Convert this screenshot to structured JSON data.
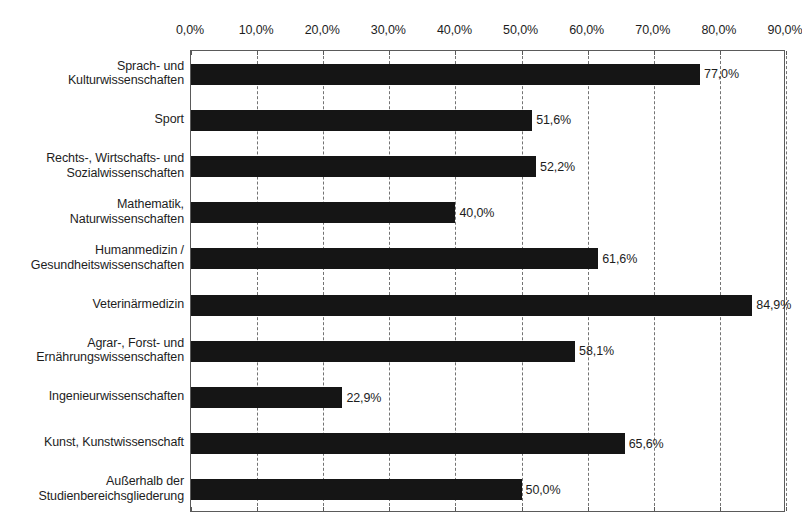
{
  "chart_data": {
    "type": "bar",
    "orientation": "horizontal",
    "title": "",
    "subtitle": "",
    "xlabel": "",
    "ylabel": "",
    "xlim": [
      0,
      90
    ],
    "grid": true,
    "legend": false,
    "value_label_suffix": "%",
    "decimal_separator": ",",
    "x_ticks": [
      {
        "value": 0,
        "label": "0,0%"
      },
      {
        "value": 10,
        "label": "10,0%"
      },
      {
        "value": 20,
        "label": "20,0%"
      },
      {
        "value": 30,
        "label": "30,0%"
      },
      {
        "value": 40,
        "label": "40,0%"
      },
      {
        "value": 50,
        "label": "50,0%"
      },
      {
        "value": 60,
        "label": "60,0%"
      },
      {
        "value": 70,
        "label": "70,0%"
      },
      {
        "value": 80,
        "label": "80,0%"
      },
      {
        "value": 90,
        "label": "90,0%"
      }
    ],
    "categories": [
      "Sprach- und Kulturwissenschaften",
      "Sport",
      "Rechts-, Wirtschafts- und Sozialwissenschaften",
      "Mathematik, Naturwissenschaften",
      "Humanmedizin / Gesundheitswissenschaften",
      "Veterinärmedizin",
      "Agrar-, Forst- und Ernährungswissenschaften",
      "Ingenieurwissenschaften",
      "Kunst, Kunstwissenschaft",
      "Außerhalb der Studienbereichsgliederung"
    ],
    "category_lines": [
      [
        "Sprach- und",
        "Kulturwissenschaften"
      ],
      [
        "Sport"
      ],
      [
        "Rechts-, Wirtschafts- und",
        "Sozialwissenschaften"
      ],
      [
        "Mathematik,",
        "Naturwissenschaften"
      ],
      [
        "Humanmedizin /",
        "Gesundheitswissenschaften"
      ],
      [
        "Veterinärmedizin"
      ],
      [
        "Agrar-, Forst- und",
        "Ernährungswissenschaften"
      ],
      [
        "Ingenieurwissenschaften"
      ],
      [
        "Kunst, Kunstwissenschaft"
      ],
      [
        "Außerhalb der",
        "Studienbereichsgliederung"
      ]
    ],
    "values": [
      77.0,
      51.6,
      52.2,
      40.0,
      61.6,
      84.9,
      58.1,
      22.9,
      65.6,
      50.0
    ],
    "value_labels": [
      "77,0%",
      "51,6%",
      "52,2%",
      "40,0%",
      "61,6%",
      "84,9%",
      "58,1%",
      "22,9%",
      "65,6%",
      "50,0%"
    ],
    "colors": {
      "bar": "#151515",
      "gridline": "#737373",
      "axis": "#5a5a5a",
      "text": "#1d1d1d",
      "background": "#ffffff"
    }
  }
}
